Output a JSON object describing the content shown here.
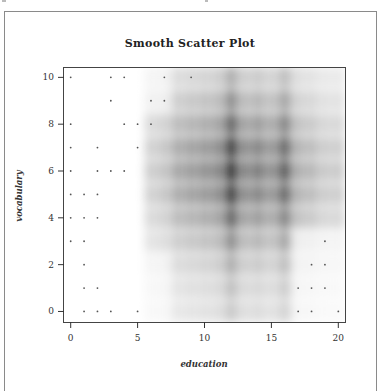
{
  "chart_data": {
    "type": "heatmap",
    "subtype": "smooth-scatter",
    "title": "Smooth Scatter Plot",
    "xlabel": "education",
    "ylabel": "vocabulary",
    "xlim": [
      -0.5,
      20.5
    ],
    "ylim": [
      -0.45,
      10.4
    ],
    "x_ticks": [
      0,
      5,
      10,
      15,
      20
    ],
    "x_tick_labels": [
      "0",
      "5",
      "10",
      "15",
      "20"
    ],
    "y_ticks": [
      0,
      2,
      4,
      6,
      8,
      10
    ],
    "y_tick_labels": [
      "0",
      "2",
      "4",
      "6",
      "8",
      "10"
    ],
    "grid": false,
    "colors": {
      "low": "#ffffff",
      "high": "#303030",
      "points": "#555555",
      "axis": "#333333"
    },
    "density_columns": [
      {
        "x": 6,
        "weight": 0.25
      },
      {
        "x": 7,
        "weight": 0.3
      },
      {
        "x": 8,
        "weight": 0.45
      },
      {
        "x": 9,
        "weight": 0.5
      },
      {
        "x": 10,
        "weight": 0.55
      },
      {
        "x": 11,
        "weight": 0.6
      },
      {
        "x": 12,
        "weight": 1.0
      },
      {
        "x": 13,
        "weight": 0.6
      },
      {
        "x": 14,
        "weight": 0.65
      },
      {
        "x": 15,
        "weight": 0.55
      },
      {
        "x": 16,
        "weight": 0.8
      },
      {
        "x": 17,
        "weight": 0.45
      },
      {
        "x": 18,
        "weight": 0.4
      },
      {
        "x": 19,
        "weight": 0.3
      },
      {
        "x": 20,
        "weight": 0.3
      }
    ],
    "density_peak": {
      "x": 12,
      "y": 6
    },
    "outlier_points": [
      {
        "x": 0,
        "y": 10
      },
      {
        "x": 3,
        "y": 10
      },
      {
        "x": 4,
        "y": 10
      },
      {
        "x": 7,
        "y": 10
      },
      {
        "x": 9,
        "y": 10
      },
      {
        "x": 3,
        "y": 9
      },
      {
        "x": 6,
        "y": 9
      },
      {
        "x": 7,
        "y": 9
      },
      {
        "x": 0,
        "y": 8
      },
      {
        "x": 4,
        "y": 8
      },
      {
        "x": 5,
        "y": 8
      },
      {
        "x": 6,
        "y": 8
      },
      {
        "x": 0,
        "y": 7
      },
      {
        "x": 2,
        "y": 7
      },
      {
        "x": 5,
        "y": 7
      },
      {
        "x": 0,
        "y": 6
      },
      {
        "x": 2,
        "y": 6
      },
      {
        "x": 3,
        "y": 6
      },
      {
        "x": 4,
        "y": 6
      },
      {
        "x": 0,
        "y": 5
      },
      {
        "x": 1,
        "y": 5
      },
      {
        "x": 2,
        "y": 5
      },
      {
        "x": 0,
        "y": 4
      },
      {
        "x": 1,
        "y": 4
      },
      {
        "x": 2,
        "y": 4
      },
      {
        "x": 0,
        "y": 3
      },
      {
        "x": 1,
        "y": 3
      },
      {
        "x": 19,
        "y": 3
      },
      {
        "x": 1,
        "y": 2
      },
      {
        "x": 18,
        "y": 2
      },
      {
        "x": 19,
        "y": 2
      },
      {
        "x": 1,
        "y": 1
      },
      {
        "x": 2,
        "y": 1
      },
      {
        "x": 17,
        "y": 1
      },
      {
        "x": 18,
        "y": 1
      },
      {
        "x": 19,
        "y": 1
      },
      {
        "x": 1,
        "y": 0
      },
      {
        "x": 2,
        "y": 0
      },
      {
        "x": 3,
        "y": 0
      },
      {
        "x": 5,
        "y": 0
      },
      {
        "x": 17,
        "y": 0
      },
      {
        "x": 18,
        "y": 0
      },
      {
        "x": 20,
        "y": 0
      }
    ]
  }
}
